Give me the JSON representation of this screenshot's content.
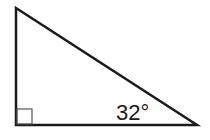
{
  "diagram": {
    "type": "right-triangle",
    "angle_label": "32°",
    "right_angle_marker": true,
    "stroke_color": "#1a1a1a",
    "background": "#ffffff"
  }
}
